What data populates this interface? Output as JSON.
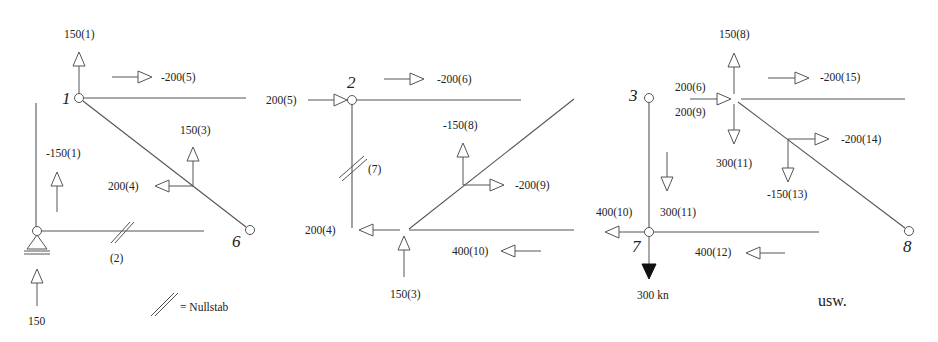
{
  "figure": {
    "panels": [
      {
        "id": "left",
        "node_labels": [
          "1",
          "6"
        ],
        "forces": [
          "150(1)",
          "-200(5)",
          "150(3)",
          "-150(1)",
          "200(4)",
          "(2)",
          "150"
        ],
        "legend": "= Nullstab"
      },
      {
        "id": "middle",
        "node_labels": [
          "2"
        ],
        "forces": [
          "-200(6)",
          "200(5)",
          "-150(8)",
          "(7)",
          "-200(9)",
          "200(4)",
          "400(10)",
          "150(3)"
        ]
      },
      {
        "id": "right",
        "node_labels": [
          "3",
          "7",
          "8"
        ],
        "forces": [
          "150(8)",
          "-200(15)",
          "200(6)",
          "200(9)",
          "300(11)",
          "-200(14)",
          "-150(13)",
          "300(11)",
          "400(10)",
          "400(12)"
        ],
        "load": "300 kn",
        "continuation": "usw."
      }
    ],
    "colors": {
      "line": "#555555",
      "text": "#222222",
      "background": "#ffffff"
    }
  }
}
